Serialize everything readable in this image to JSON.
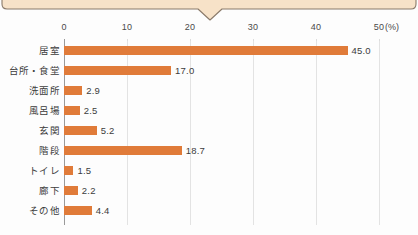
{
  "bubble": {
    "name": "speech-bubble-bottom-edge",
    "fill": "#f7e2c8",
    "stroke": "#8a7a6a",
    "tail_center_x": 210
  },
  "chart_data": {
    "type": "bar",
    "orientation": "horizontal",
    "title": "",
    "subtitle": "",
    "xlabel": "",
    "ylabel": "",
    "unit_label": "(%)",
    "xlim": [
      0,
      50
    ],
    "xticks": [
      0,
      10,
      20,
      30,
      40,
      50
    ],
    "xtick_labels": [
      "0",
      "10",
      "20",
      "30",
      "40",
      "50"
    ],
    "grid": true,
    "legend": null,
    "bar_color": "#e07b39",
    "categories": [
      "居室",
      "台所・食堂",
      "洗面所",
      "風呂場",
      "玄関",
      "階段",
      "トイレ",
      "廊下",
      "その他"
    ],
    "values": [
      45.0,
      17.0,
      2.9,
      2.5,
      5.2,
      18.7,
      1.5,
      2.2,
      4.4
    ],
    "value_labels": [
      "45.0",
      "17.0",
      "2.9",
      "2.5",
      "5.2",
      "18.7",
      "1.5",
      "2.2",
      "4.4"
    ]
  }
}
